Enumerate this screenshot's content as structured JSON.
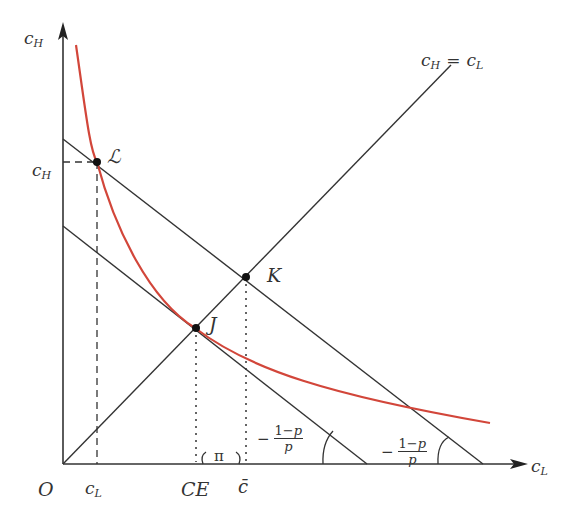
{
  "diagram": {
    "type": "economics-insurance-diagram",
    "axes": {
      "x_label": "c",
      "x_sub": "L",
      "y_label": "c",
      "y_sub": "H",
      "origin_label": "O"
    },
    "certainty_line": {
      "label_left": "c",
      "label_left_sub": "H",
      "eq": "=",
      "label_right": "c",
      "label_right_sub": "L"
    },
    "points": {
      "L": "ℒ",
      "J": "J",
      "K": "K"
    },
    "x_ticks": {
      "cL": "c",
      "cL_sub": "L",
      "CE": "CE",
      "cbar": "c̄"
    },
    "y_ticks": {
      "cH": "c",
      "cH_sub": "H"
    },
    "risk_premium": "π",
    "slope_labels": [
      {
        "minus": "−",
        "num_1": "1−",
        "num_p": "p",
        "den": "p"
      },
      {
        "minus": "−",
        "num_1": "1−",
        "num_p": "p",
        "den": "p"
      }
    ],
    "colors": {
      "axis": "#333333",
      "lines": "#333333",
      "indifference_curve": "#d2463a"
    }
  }
}
